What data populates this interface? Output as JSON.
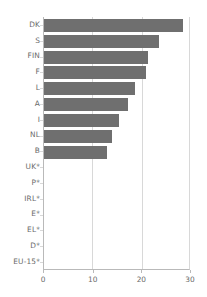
{
  "chart_data": {
    "type": "bar",
    "orientation": "horizontal",
    "title": "",
    "subtitle": "",
    "xlabel": "",
    "ylabel": "",
    "xlim": [
      0,
      30
    ],
    "xticks": [
      0,
      10,
      20,
      30
    ],
    "xtick_labels": [
      "0",
      "10",
      "20",
      "30"
    ],
    "grid": true,
    "grid_axis": "x",
    "legend": null,
    "legend_position": "none",
    "bar_color": "#6f6f6f",
    "axis_color": "#b9b9b9",
    "grid_color": "#d8d8d8",
    "label_color": "#6a6a6a",
    "categories": [
      "DK",
      "S",
      "FIN",
      "F",
      "L",
      "A",
      "I",
      "NL",
      "B",
      "UK*",
      "P*",
      "IRL*",
      "E*",
      "EL*",
      "D*",
      "EU-15*"
    ],
    "values": [
      28.5,
      23.7,
      21.4,
      21.0,
      18.8,
      17.2,
      15.4,
      13.9,
      13.0,
      null,
      null,
      null,
      null,
      null,
      null,
      null
    ],
    "footnote": ""
  }
}
